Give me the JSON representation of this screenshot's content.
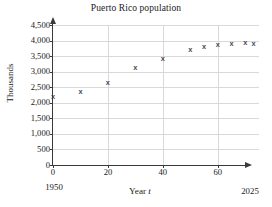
{
  "chart_data": {
    "type": "scatter",
    "title": "Puerto Rico population",
    "xlabel": "Year t",
    "ylabel": "Thousands",
    "xlim": [
      0,
      75
    ],
    "ylim": [
      0,
      4500
    ],
    "grid": true,
    "legend": null,
    "x_tick_labels": [
      "0",
      "20",
      "40",
      "60"
    ],
    "x_ticks": [
      0,
      20,
      40,
      60
    ],
    "y_tick_labels": [
      "0",
      "500",
      "1,000",
      "1,500",
      "2,000",
      "2,500",
      "3,000",
      "3,500",
      "4,000",
      "4,500"
    ],
    "y_ticks": [
      0,
      500,
      1000,
      1500,
      2000,
      2500,
      3000,
      3500,
      4000,
      4500
    ],
    "axis_start_year": "1950",
    "axis_end_year": "2025",
    "marker_symbol": "x",
    "marker_color": "#4a4a58",
    "grid_color": "#d9d9d9",
    "axis_color": "#3a3a3a",
    "x": [
      0,
      10,
      20,
      30,
      40,
      50,
      55,
      60,
      65,
      70,
      73,
      45
    ],
    "y": [
      2210,
      2350,
      2650,
      3150,
      3420,
      3700,
      3810,
      3870,
      3920,
      3930,
      3920,
      3540
    ],
    "points": [
      {
        "t": 0,
        "value": 2210
      },
      {
        "t": 10,
        "value": 2350
      },
      {
        "t": 20,
        "value": 2650
      },
      {
        "t": 30,
        "value": 3150
      },
      {
        "t": 40,
        "value": 3420
      },
      {
        "t": 50,
        "value": 3700
      },
      {
        "t": 55,
        "value": 3810
      },
      {
        "t": 60,
        "value": 3870
      },
      {
        "t": 65,
        "value": 3920
      },
      {
        "t": 70,
        "value": 3930
      },
      {
        "t": 73,
        "value": 3920
      }
    ]
  }
}
